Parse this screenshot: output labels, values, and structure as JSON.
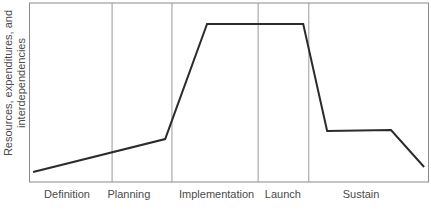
{
  "chart_data": {
    "type": "line",
    "title": "",
    "xlabel": "",
    "ylabel": "Resources, expenditures, and interdependencies",
    "ylabel_lines": [
      "Resources, expenditures, and",
      "interdependencies"
    ],
    "phases": [
      {
        "label": "Definition",
        "center_frac": 0.094
      },
      {
        "label": "Planning",
        "center_frac": 0.249
      },
      {
        "label": "Implementation",
        "center_frac": 0.469
      },
      {
        "label": "Launch",
        "center_frac": 0.635
      },
      {
        "label": "Sustain",
        "center_frac": 0.831
      }
    ],
    "divider_fracs": [
      0.207,
      0.357,
      0.573,
      0.7
    ],
    "series": [
      {
        "name": "resource-curve",
        "points": [
          {
            "x": 0.009,
            "y": 0.056
          },
          {
            "x": 0.34,
            "y": 0.24
          },
          {
            "x": 0.445,
            "y": 0.883
          },
          {
            "x": 0.686,
            "y": 0.883
          },
          {
            "x": 0.746,
            "y": 0.285
          },
          {
            "x": 0.906,
            "y": 0.29
          },
          {
            "x": 0.989,
            "y": 0.084
          }
        ]
      }
    ],
    "xlim": [
      0,
      1
    ],
    "ylim": [
      0,
      1
    ],
    "grid": "vertical phase dividers only",
    "legend": "none",
    "colors": {
      "line": "#2b2b2b",
      "frame": "#8a8a8a",
      "divider": "#9a9a9a",
      "text": "#4a4a4a",
      "background": "#ffffff"
    }
  }
}
